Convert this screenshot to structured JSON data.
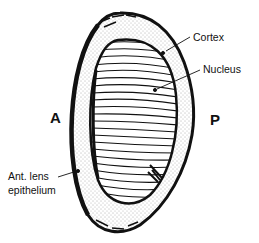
{
  "diagram": {
    "labels": {
      "cortex": "Cortex",
      "nucleus": "Nucleus",
      "anterior": "A",
      "posterior": "P",
      "epithelium_line1": "Ant. lens",
      "epithelium_line2": "epithelium"
    },
    "colors": {
      "ink": "#111111",
      "background": "#ffffff",
      "stipple": "#555555"
    }
  }
}
